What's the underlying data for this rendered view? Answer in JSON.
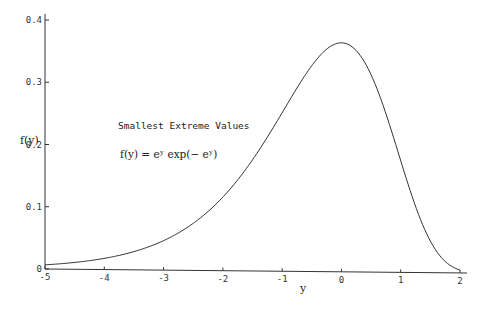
{
  "chart_data": {
    "type": "line",
    "title": "Smallest Extreme Values",
    "formula": "f(y) = eʸ exp(− eʸ)",
    "xlabel": "y",
    "ylabel": "f(y)",
    "xlim": [
      -5,
      2
    ],
    "ylim": [
      0,
      0.4
    ],
    "grid": false,
    "x_ticks": [
      -5,
      -4,
      -3,
      -2,
      -1,
      0,
      1,
      2
    ],
    "x_tick_labels": [
      "-5",
      "-4",
      "-3",
      "-2",
      "-1",
      "0",
      "1",
      "2"
    ],
    "y_ticks": [
      0,
      0.1,
      0.2,
      0.3,
      0.4
    ],
    "y_tick_labels": [
      "0",
      "0.1",
      "0.2",
      "0.3",
      "0.4"
    ],
    "series": [
      {
        "name": "f(y)",
        "function": "exp(y) * exp(-exp(y))",
        "x": [
          -5,
          -4.5,
          -4,
          -3.5,
          -3,
          -2.5,
          -2,
          -1.5,
          -1,
          -0.5,
          0,
          0.25,
          0.5,
          0.75,
          1,
          1.25,
          1.5,
          1.75,
          2
        ],
        "values": [
          0.0067,
          0.011,
          0.018,
          0.0292,
          0.0474,
          0.0755,
          0.1182,
          0.1793,
          0.2546,
          0.3296,
          0.3679,
          0.3564,
          0.3174,
          0.2569,
          0.1794,
          0.1047,
          0.0498,
          0.0186,
          0.0045
        ]
      }
    ]
  }
}
